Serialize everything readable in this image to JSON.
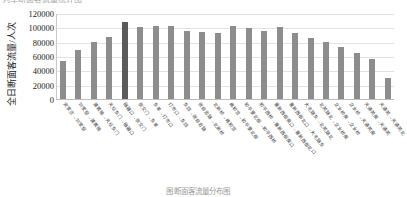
{
  "top_title": "列车断面客流量统计图",
  "caption": "图 断面客流量分布图",
  "chart_data": {
    "type": "bar",
    "title": "列车断面客流量统计图",
    "xlabel": "",
    "ylabel": "全日断面客流量/人次",
    "ylim": [
      0,
      120000
    ],
    "yticks": [
      "0",
      "20000",
      "40000",
      "60000",
      "80000",
      "100000",
      "120000"
    ],
    "grid": true,
    "legend": "none",
    "bar_color": "#8d8d8d",
    "highlight_color": "#5a5a5a",
    "highlight_index": 4,
    "categories": [
      "宋家庄→刘家窑",
      "刘家窑→蒲黄榆",
      "蒲黄榆→天坛东门",
      "天坛东门→磁器口",
      "磁器口→崇文门",
      "崇文门→东单",
      "东单→灯市口",
      "灯市口→东四",
      "东四→张自忠路",
      "张自忠路→北新桥",
      "北新桥→雍和宫",
      "雍和宫→和平里北街",
      "和平里北街→和平西桥",
      "和平西桥→惠新西街南口",
      "惠新西街南口→惠新西街北口",
      "惠新西街北口→大屯路东",
      "大屯路东→北苑路北",
      "北苑路北→立水桥南",
      "立水桥南→立水桥",
      "立水桥→天通苑南",
      "天通苑南→天通苑",
      "天通苑→天通苑北"
    ],
    "values": [
      53000,
      68000,
      80000,
      87000,
      108000,
      100000,
      102000,
      102000,
      95000,
      94000,
      92000,
      102000,
      99000,
      95000,
      101000,
      92000,
      85000,
      79000,
      73000,
      64000,
      56000,
      30000
    ]
  }
}
